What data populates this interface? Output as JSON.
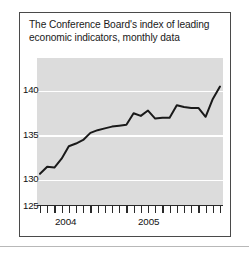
{
  "chart_data": {
    "type": "line",
    "title": "The Conference Board's index of leading economic indicators, monthly data",
    "title_line1": "The Conference Board's index of leading",
    "title_line2": "economic indicators, monthly data",
    "xlabel": "",
    "ylabel": "",
    "ylim": [
      125,
      141.5
    ],
    "yticks": [
      125,
      130,
      135,
      140
    ],
    "ytick_labels": [
      "125",
      "130",
      "135",
      "140"
    ],
    "grid": true,
    "grid_color": "#ffffff",
    "plot_background": "#dcdcdc",
    "line_color": "#1a1a1a",
    "legend": null,
    "x_axis_tick_count": 26,
    "x_tick_interval": "monthly",
    "xtick_labels": [
      "2004",
      "2005"
    ],
    "xtick_label_positions": [
      5.5,
      17.5
    ],
    "series": [
      {
        "name": "Leading economic indicators index",
        "x": [
          0,
          1,
          2,
          3,
          4,
          5,
          6,
          7,
          8,
          9,
          10,
          11,
          12,
          13,
          14,
          15,
          16,
          17,
          18,
          19,
          20,
          21,
          22,
          23,
          24,
          25
        ],
        "values": [
          128.5,
          129.3,
          129.2,
          130.2,
          131.6,
          131.9,
          132.3,
          133.1,
          133.4,
          133.6,
          133.8,
          133.9,
          134.0,
          135.3,
          135.0,
          135.6,
          134.7,
          134.8,
          134.8,
          136.2,
          136.0,
          135.9,
          135.9,
          134.9,
          136.9,
          138.3
        ]
      }
    ]
  },
  "axis": {
    "year_2004": "2004",
    "year_2005": "2005"
  }
}
